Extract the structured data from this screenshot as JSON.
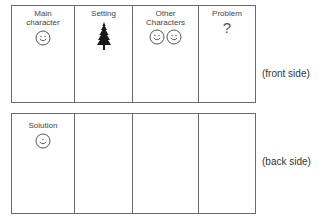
{
  "front_card": {
    "side_label": "(front side)",
    "cells": [
      {
        "label_line1": "Main",
        "label_line2": "character",
        "icon": "smiley-face-icon",
        "icon_count": 1
      },
      {
        "label_line1": "Setting",
        "label_line2": "",
        "icon": "pine-tree-icon",
        "icon_count": 1
      },
      {
        "label_line1": "Other",
        "label_line2": "Characters",
        "icon": "smiley-face-icon",
        "icon_count": 2
      },
      {
        "label_line1": "Problem",
        "label_line2": "",
        "icon": "question-mark-icon",
        "icon_count": 1,
        "glyph": "?"
      }
    ]
  },
  "back_card": {
    "side_label": "(back side)",
    "cells": [
      {
        "label_line1": "Solution",
        "label_line2": "",
        "icon": "smiley-face-icon",
        "icon_count": 1
      },
      {
        "label_line1": "",
        "label_line2": ""
      },
      {
        "label_line1": "",
        "label_line2": ""
      },
      {
        "label_line1": "",
        "label_line2": ""
      }
    ]
  },
  "colors": {
    "border": "#6a6a6a",
    "text": "#444444",
    "tree": "#1a1a1a"
  }
}
